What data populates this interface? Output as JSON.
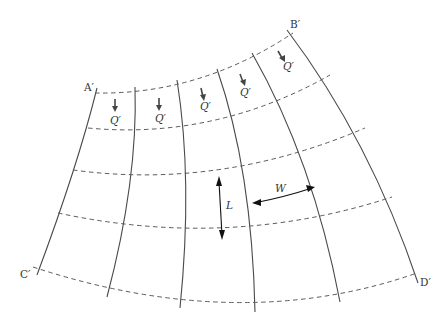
{
  "diagram": {
    "corner_labels": {
      "top_left": "A′",
      "top_right": "B′",
      "bottom_left": "C′",
      "bottom_right": "D′"
    },
    "flow_label": "Q′",
    "flow_label_count": 5,
    "dimension_labels": {
      "length": "L",
      "width": "W"
    },
    "line_types": {
      "streamlines": "solid",
      "equipotential_lines": "dashed"
    },
    "colors": {
      "background": "#ffffff",
      "lines": "#4a4a4a",
      "dimension_arrows": "#111111"
    }
  }
}
